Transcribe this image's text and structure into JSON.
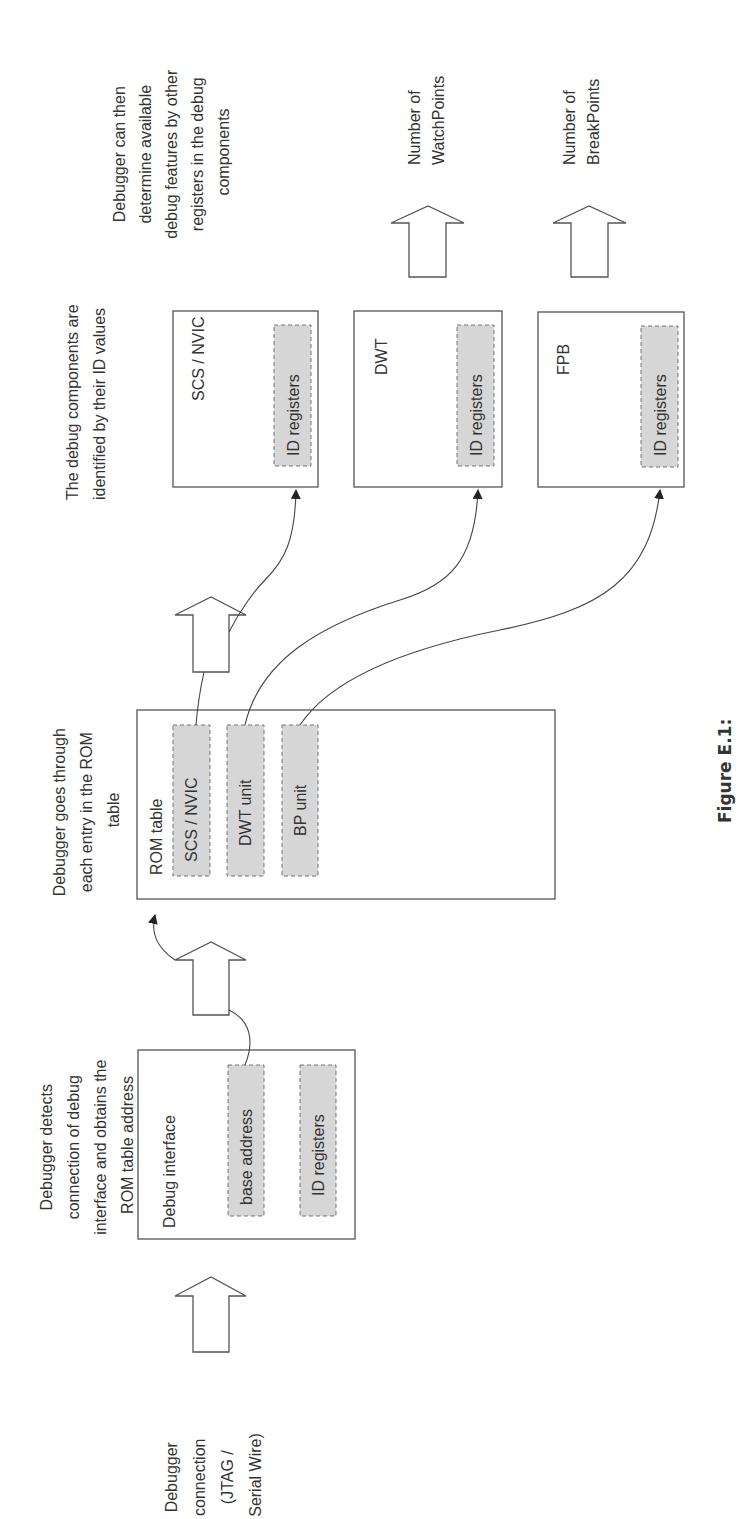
{
  "figure": {
    "caption": "Figure E.1:",
    "orientation": "rotated -90deg (landscape figure on portrait page)"
  },
  "steps": {
    "connection": {
      "label_lines": [
        "Debugger",
        "connection",
        "(JTAG /",
        "Serial Wire)"
      ]
    },
    "detect": {
      "label_lines": [
        "Debugger detects",
        "connection of debug",
        "interface and obtains the",
        "ROM table address"
      ]
    },
    "rom_walk": {
      "label_lines": [
        "Debugger goes through",
        "each entry in the ROM",
        "table"
      ]
    },
    "identify": {
      "label_lines": [
        "The debug components are",
        "identified by their ID values"
      ]
    },
    "features": {
      "label_lines": [
        "Debugger can then",
        "determine available",
        "debug features by other",
        "registers in the debug",
        "components"
      ]
    }
  },
  "blocks": {
    "debug_interface": {
      "title": "Debug interface",
      "registers": [
        "base address",
        "ID registers"
      ]
    },
    "rom_table": {
      "title": "ROM table",
      "entries": [
        "SCS / NVIC",
        "DWT unit",
        "BP unit"
      ]
    },
    "components": [
      {
        "title": "SCS / NVIC",
        "register": "ID registers"
      },
      {
        "title": "DWT",
        "register": "ID registers"
      },
      {
        "title": "FPB",
        "register": "ID registers"
      }
    ]
  },
  "outputs": {
    "watchpoints": {
      "label_lines": [
        "Number of",
        "WatchPoints"
      ]
    },
    "breakpoints": {
      "label_lines": [
        "Number of",
        "BreakPoints"
      ]
    }
  },
  "colors": {
    "line": "#555555",
    "register_fill": "#d6d6d6",
    "text": "#333333"
  }
}
